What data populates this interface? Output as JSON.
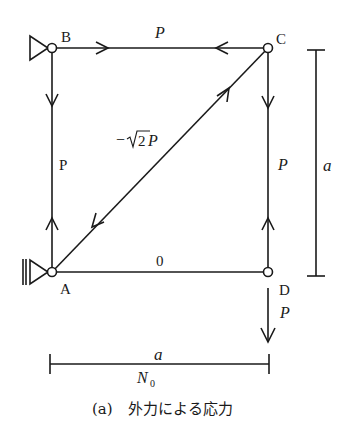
{
  "figure": {
    "caption": "(a)　外力による応力",
    "nodes": {
      "A": {
        "label": "A"
      },
      "B": {
        "label": "B"
      },
      "C": {
        "label": "C"
      },
      "D": {
        "label": "D"
      }
    },
    "members": {
      "BC": {
        "force": "P"
      },
      "AB": {
        "force": "P"
      },
      "CD": {
        "force": "P"
      },
      "AC": {
        "force": "−√2P",
        "minus": "−",
        "sqrt_num": "2",
        "sym": "P"
      },
      "AD": {
        "force": "0"
      }
    },
    "load_D": {
      "label": "P"
    },
    "dimensions": {
      "height": {
        "label": "a"
      },
      "width": {
        "label": "a",
        "sublabel": "N",
        "sublabel_sub": "0"
      }
    }
  }
}
